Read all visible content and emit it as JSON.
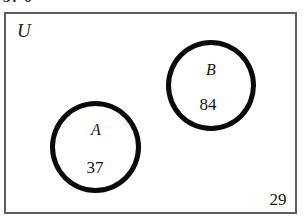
{
  "figure": {
    "type": "venn-diagram",
    "top_fragment_text": "3. 6",
    "universe_label": "U",
    "outside_count": "29",
    "sets": [
      {
        "key": "a",
        "name": "A",
        "count": "37"
      },
      {
        "key": "b",
        "name": "B",
        "count": "84"
      }
    ],
    "colors": {
      "rect_border": "#5f5f5f",
      "circle_stroke": "#0a0a0a",
      "text": "#151515",
      "background": "#ffffff"
    }
  },
  "chart_data": {
    "type": "venn",
    "title": "",
    "universe_label": "U",
    "regions": [
      {
        "label": "A only",
        "value": 37
      },
      {
        "label": "B only",
        "value": 84
      },
      {
        "label": "A and B",
        "value": 0
      },
      {
        "label": "Outside A and B",
        "value": 29
      }
    ],
    "sets": [
      "A",
      "B"
    ],
    "disjoint": true,
    "total": 150
  }
}
